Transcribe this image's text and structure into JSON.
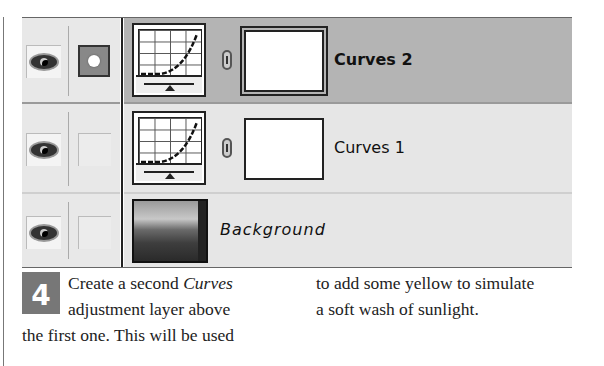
{
  "layers": [
    {
      "name": "Curves 2",
      "type": "adjustment-curves",
      "selected": true,
      "visible": true,
      "mask_icon_active": true
    },
    {
      "name": "Curves 1",
      "type": "adjustment-curves",
      "selected": false,
      "visible": true,
      "mask_icon_active": false
    },
    {
      "name": "Background",
      "type": "image",
      "selected": false,
      "visible": true,
      "mask_icon_active": false
    }
  ],
  "icons": {
    "visibility": "eye-icon",
    "mask_mode": "layer-mask-icon",
    "link": "chain-link-icon"
  },
  "colors": {
    "selected_row": "#b4b4b4",
    "normal_row": "#e6e6e6",
    "step_badge": "#777777"
  },
  "step": {
    "number": "4",
    "col1_line1_pre": "Create a second ",
    "col1_line1_italic": "Curves",
    "col1_line2": "adjustment layer above",
    "col1_line3": "the first one. This will be used",
    "col2_line1": "to add some yellow to simulate",
    "col2_line2": "a soft wash of sunlight."
  }
}
